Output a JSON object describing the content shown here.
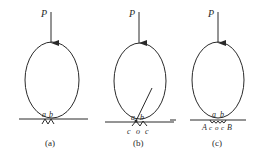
{
  "figure": {
    "panels": [
      {
        "id": "a",
        "caption": "(a)",
        "force_label": "P",
        "contact_labels": [
          "a",
          "b"
        ],
        "bottom_labels": []
      },
      {
        "id": "b",
        "caption": "(b)",
        "force_label": "P",
        "contact_labels": [
          "a",
          "b"
        ],
        "bottom_labels": [
          "c",
          "o",
          "c"
        ]
      },
      {
        "id": "c",
        "caption": "(c)",
        "force_label": "P",
        "contact_labels": [
          "a",
          "b"
        ],
        "bottom_labels": [
          "A",
          "c",
          "o",
          "c",
          "B"
        ]
      }
    ]
  }
}
